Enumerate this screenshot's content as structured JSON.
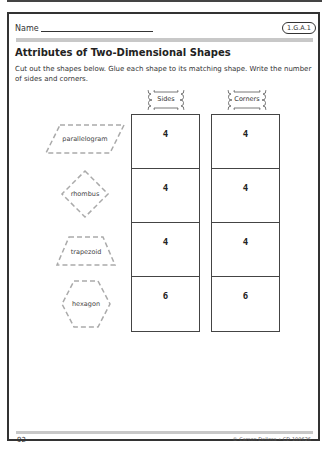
{
  "header": {
    "name_label": "Name",
    "standard_badge": "1.G.A.1"
  },
  "title": "Attributes of Two-Dimensional Shapes",
  "instructions": "Cut out the shapes below. Glue each shape to its matching shape. Write the number of sides and corners.",
  "columns": [
    {
      "label": "Sides"
    },
    {
      "label": "Corners"
    }
  ],
  "rows": [
    {
      "shape": "parallelogram",
      "sides": "4",
      "corners": "4"
    },
    {
      "shape": "rhombus",
      "sides": "4",
      "corners": "4"
    },
    {
      "shape": "trapezoid",
      "sides": "4",
      "corners": "4"
    },
    {
      "shape": "hexagon",
      "sides": "6",
      "corners": "6"
    }
  ],
  "footer": {
    "page_number": "92",
    "copyright": "© Carson Dellosa • CD-109626"
  }
}
